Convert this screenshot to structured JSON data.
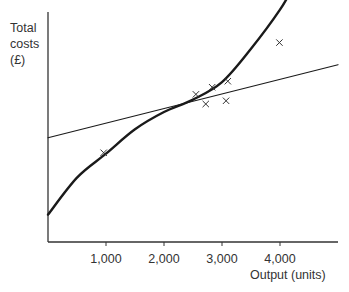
{
  "chart_data": {
    "type": "line",
    "title": "",
    "xlabel": "Output (units)",
    "ylabel_lines": [
      "Total",
      "costs",
      "(£)"
    ],
    "xlim": [
      0,
      5000
    ],
    "ylim": [
      0,
      100
    ],
    "x_ticks": [
      1000,
      2000,
      3000,
      4000
    ],
    "x_tick_labels": [
      "1,000",
      "2,000",
      "3,000",
      "4,000"
    ],
    "y_ticks": [],
    "grid": false,
    "series": [
      {
        "name": "cubic-total-cost-curve",
        "style": "thick",
        "x": [
          0,
          500,
          1000,
          1500,
          2000,
          2500,
          3000,
          3500,
          4000,
          4250
        ],
        "values": [
          11.9,
          28.0,
          38.4,
          49.0,
          56.5,
          61.9,
          69.5,
          84.0,
          101.0,
          112.0
        ]
      },
      {
        "name": "linear-fit",
        "style": "thin",
        "x": [
          0,
          5000
        ],
        "values": [
          45.3,
          77.1
        ]
      }
    ],
    "points": [
      {
        "x": 960,
        "y": 38.8
      },
      {
        "x": 2720,
        "y": 60.0
      },
      {
        "x": 2830,
        "y": 67.3
      },
      {
        "x": 3100,
        "y": 69.9
      },
      {
        "x": 2550,
        "y": 64.2
      },
      {
        "x": 3070,
        "y": 61.4
      },
      {
        "x": 3990,
        "y": 86.7
      }
    ],
    "marker": "x"
  }
}
